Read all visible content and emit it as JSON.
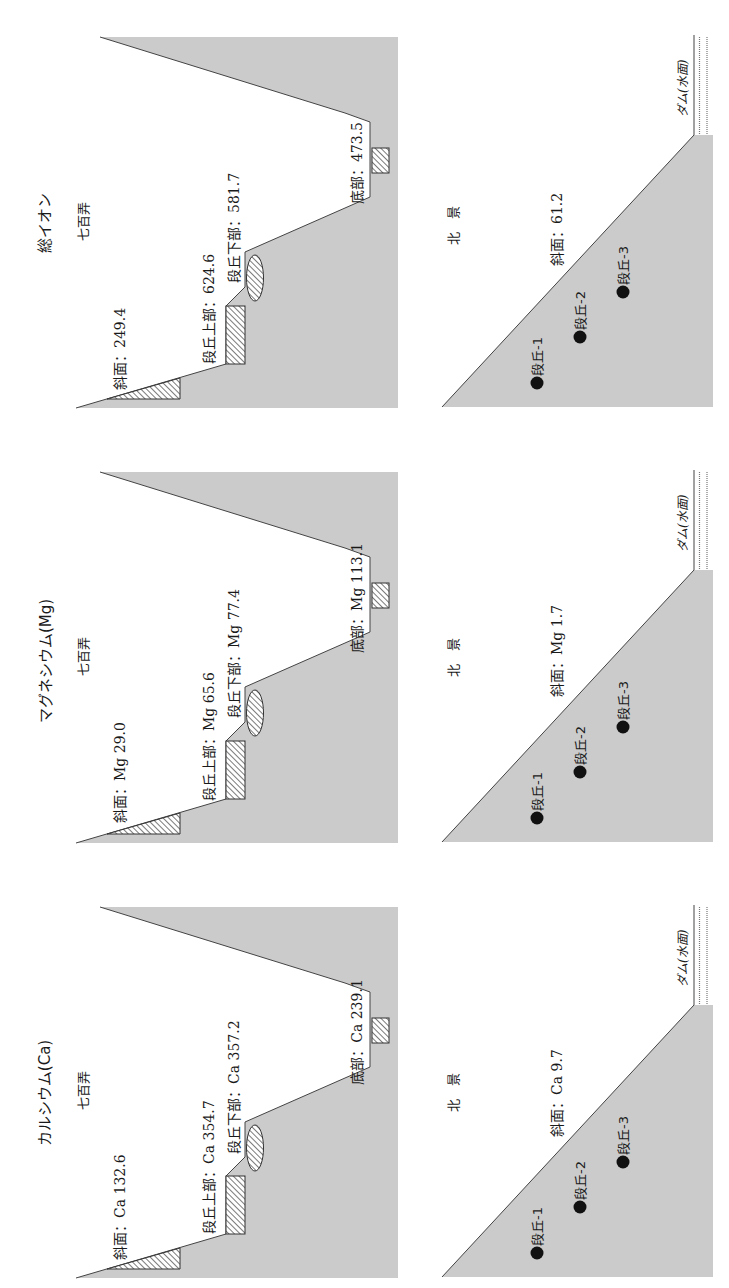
{
  "colors": {
    "terrain": "#cbcbcb",
    "line": "#444444",
    "text": "#1a1a1a",
    "point": "#111111"
  },
  "panels": [
    {
      "title": "総イオン",
      "valley_site": {
        "name": "七百弄",
        "slope": "斜面：249.4",
        "terrace_upper": "段丘上部：624.6",
        "terrace_lower": "段丘下部：581.7",
        "bottom": "底部：473.5"
      },
      "slope_site": {
        "name": "北　景",
        "slope": "斜面：61.2",
        "points": [
          "段丘-1",
          "段丘-2",
          "段丘-3"
        ],
        "dam": "ダム(水面)"
      }
    },
    {
      "title": "マグネシウム(Mg)",
      "valley_site": {
        "name": "七百弄",
        "slope": "斜面：Mg 29.0",
        "terrace_upper": "段丘上部：Mg 65.6",
        "terrace_lower": "段丘下部：Mg 77.4",
        "bottom": "底部：Mg 113.1"
      },
      "slope_site": {
        "name": "北　景",
        "slope": "斜面：Mg 1.7",
        "points": [
          "段丘-1",
          "段丘-2",
          "段丘-3"
        ],
        "dam": "ダム(水面)"
      }
    },
    {
      "title": "カルシウム(Ca)",
      "valley_site": {
        "name": "七百弄",
        "slope": "斜面：Ca 132.6",
        "terrace_upper": "段丘上部：Ca 354.7",
        "terrace_lower": "段丘下部：Ca 357.2",
        "bottom": "底部：Ca 239.1"
      },
      "slope_site": {
        "name": "北　景",
        "slope": "斜面：Ca 9.7",
        "points": [
          "段丘-1",
          "段丘-2",
          "段丘-3"
        ],
        "dam": "ダム(水面)"
      }
    }
  ]
}
